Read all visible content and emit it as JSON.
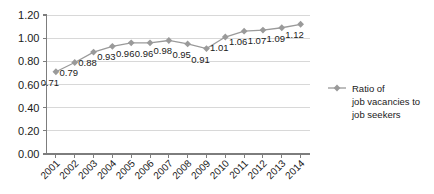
{
  "chart_data": {
    "type": "line",
    "title": "",
    "xlabel": "",
    "ylabel": "",
    "categories": [
      "2001",
      "2002",
      "2003",
      "2004",
      "2005",
      "2006",
      "2007",
      "2008",
      "2009",
      "2010",
      "2011",
      "2012",
      "2013",
      "2014"
    ],
    "values": [
      0.71,
      0.79,
      0.88,
      0.93,
      0.96,
      0.96,
      0.98,
      0.95,
      0.91,
      1.01,
      1.06,
      1.07,
      1.09,
      1.12
    ],
    "data_labels": [
      "0.71",
      "0.79",
      "0.88",
      "0.93",
      "0.96",
      "0.96",
      "0.98",
      "0.95",
      "0.91",
      "1.01",
      "1.06",
      "1.07",
      "1.09",
      "1.12"
    ],
    "ylim": [
      0.0,
      1.2
    ],
    "yticks": [
      0.0,
      0.2,
      0.4,
      0.6,
      0.8,
      1.0,
      1.2
    ],
    "ytick_labels": [
      "0.00",
      "0.20",
      "0.40",
      "0.60",
      "0.80",
      "1.00",
      "1.20"
    ],
    "grid": true,
    "grid_axis": "y",
    "legend_position": "right",
    "series": [
      {
        "name": "Ratio of job vacancies to job seekers",
        "name_lines": [
          "Ratio of",
          "job vacancies to",
          "job seekers"
        ],
        "marker": "diamond",
        "color": "#9a9a9a",
        "values": [
          0.71,
          0.79,
          0.88,
          0.93,
          0.96,
          0.96,
          0.98,
          0.95,
          0.91,
          1.01,
          1.06,
          1.07,
          1.09,
          1.12
        ]
      }
    ]
  },
  "colors": {
    "series": "#9a9a9a",
    "gridline": "#d8d8d8",
    "axis": "#7d7d7d",
    "text": "#1a1a1a",
    "background": "#ffffff"
  }
}
